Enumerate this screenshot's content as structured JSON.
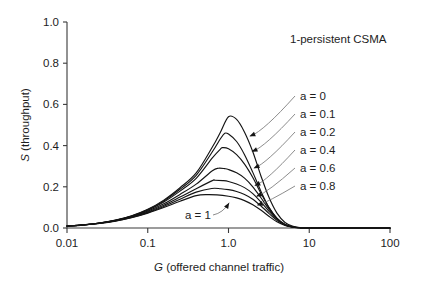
{
  "chart_data": {
    "type": "line",
    "title": "1-persistent CSMA",
    "xlabel": "G (offered channel traffic)",
    "ylabel": "S (throughput)",
    "xlabel_italic_prefix": "G",
    "xlabel_rest": " (offered channel traffic)",
    "ylabel_italic_prefix": "S",
    "ylabel_rest": " (throughput)",
    "xscale": "log",
    "xlim": [
      0.01,
      100
    ],
    "ylim": [
      0.0,
      1.0
    ],
    "grid": false,
    "legend_position": "inline-annotations",
    "xticks": [
      "0.01",
      "0.1",
      "1.0",
      "10",
      "100"
    ],
    "xtick_values": [
      0.01,
      0.1,
      1.0,
      10,
      100
    ],
    "yticks": [
      "0.0",
      "0.2",
      "0.4",
      "0.6",
      "0.8",
      "1.0"
    ],
    "ytick_values": [
      0.0,
      0.2,
      0.4,
      0.6,
      0.8,
      1.0
    ],
    "series": [
      {
        "name": "a = 0",
        "a": 0,
        "peak_x": 1.0,
        "peak_y": 0.54,
        "x": [
          0.01,
          0.0158,
          0.0251,
          0.0398,
          0.0631,
          0.1,
          0.158,
          0.251,
          0.398,
          0.631,
          0.794,
          1.0,
          1.26,
          1.58,
          2.0,
          2.51,
          3.16,
          3.98,
          5.01,
          6.31,
          7.94,
          10,
          15.8,
          25.1,
          100
        ],
        "values": [
          0.0099,
          0.0156,
          0.0245,
          0.0383,
          0.0594,
          0.0906,
          0.1353,
          0.1955,
          0.2672,
          0.393,
          0.465,
          0.54,
          0.527,
          0.465,
          0.37,
          0.255,
          0.15,
          0.072,
          0.027,
          0.008,
          0.002,
          0.0005,
          0.0,
          0.0,
          0.0
        ]
      },
      {
        "name": "a = 0.1",
        "a": 0.1,
        "peak_x": 0.9,
        "peak_y": 0.46,
        "x": [
          0.01,
          0.0158,
          0.0251,
          0.0398,
          0.0631,
          0.1,
          0.158,
          0.251,
          0.398,
          0.631,
          0.794,
          0.9,
          1.0,
          1.26,
          1.58,
          2.0,
          2.51,
          3.16,
          3.98,
          5.01,
          6.31,
          7.94,
          10,
          100
        ],
        "values": [
          0.0098,
          0.0154,
          0.0242,
          0.0378,
          0.0584,
          0.0886,
          0.131,
          0.188,
          0.256,
          0.37,
          0.433,
          0.46,
          0.456,
          0.42,
          0.356,
          0.27,
          0.18,
          0.1,
          0.045,
          0.015,
          0.004,
          0.001,
          0.0003,
          0.0
        ]
      },
      {
        "name": "a = 0.2",
        "a": 0.2,
        "peak_x": 0.85,
        "peak_y": 0.39,
        "x": [
          0.01,
          0.0158,
          0.0251,
          0.0398,
          0.0631,
          0.1,
          0.158,
          0.251,
          0.398,
          0.631,
          0.794,
          0.85,
          1.0,
          1.26,
          1.58,
          2.0,
          2.51,
          3.16,
          3.98,
          5.01,
          6.31,
          7.94,
          10,
          100
        ],
        "values": [
          0.0097,
          0.0152,
          0.0239,
          0.0372,
          0.0572,
          0.0862,
          0.1262,
          0.179,
          0.241,
          0.34,
          0.383,
          0.39,
          0.385,
          0.356,
          0.31,
          0.245,
          0.17,
          0.1,
          0.048,
          0.017,
          0.005,
          0.0012,
          0.0004,
          0.0
        ]
      },
      {
        "name": "a = 0.4",
        "a": 0.4,
        "peak_x": 0.75,
        "peak_y": 0.29,
        "x": [
          0.01,
          0.0158,
          0.0251,
          0.0398,
          0.0631,
          0.1,
          0.158,
          0.251,
          0.398,
          0.631,
          0.75,
          0.9,
          1.0,
          1.26,
          1.58,
          2.0,
          2.51,
          3.16,
          3.98,
          5.01,
          6.31,
          7.94,
          10,
          100
        ],
        "values": [
          0.0095,
          0.0149,
          0.0233,
          0.036,
          0.055,
          0.0818,
          0.1175,
          0.163,
          0.213,
          0.278,
          0.29,
          0.288,
          0.284,
          0.268,
          0.242,
          0.2,
          0.148,
          0.092,
          0.046,
          0.017,
          0.005,
          0.0012,
          0.0004,
          0.0
        ]
      },
      {
        "name": "a = 0.6",
        "a": 0.6,
        "peak_x": 0.68,
        "peak_y": 0.232,
        "x": [
          0.01,
          0.0158,
          0.0251,
          0.0398,
          0.0631,
          0.1,
          0.158,
          0.251,
          0.398,
          0.631,
          0.68,
          0.85,
          1.0,
          1.26,
          1.58,
          2.0,
          2.51,
          3.16,
          3.98,
          5.01,
          6.31,
          7.94,
          10,
          100
        ],
        "values": [
          0.0094,
          0.0146,
          0.0228,
          0.035,
          0.0531,
          0.078,
          0.1105,
          0.15,
          0.191,
          0.23,
          0.232,
          0.23,
          0.226,
          0.214,
          0.196,
          0.167,
          0.127,
          0.082,
          0.042,
          0.016,
          0.0048,
          0.0011,
          0.0004,
          0.0
        ]
      },
      {
        "name": "a = 0.8",
        "a": 0.8,
        "peak_x": 0.62,
        "peak_y": 0.192,
        "x": [
          0.01,
          0.0158,
          0.0251,
          0.0398,
          0.0631,
          0.1,
          0.158,
          0.251,
          0.398,
          0.62,
          0.8,
          1.0,
          1.26,
          1.58,
          2.0,
          2.51,
          3.16,
          3.98,
          5.01,
          6.31,
          7.94,
          10,
          100
        ],
        "values": [
          0.0093,
          0.0144,
          0.0224,
          0.0342,
          0.0515,
          0.0748,
          0.1045,
          0.1395,
          0.174,
          0.192,
          0.1905,
          0.186,
          0.177,
          0.163,
          0.14,
          0.108,
          0.071,
          0.037,
          0.0145,
          0.0044,
          0.001,
          0.0003,
          0.0
        ]
      },
      {
        "name": "a = 1",
        "a": 1,
        "peak_x": 0.55,
        "peak_y": 0.162,
        "x": [
          0.01,
          0.0158,
          0.0251,
          0.0398,
          0.0631,
          0.1,
          0.158,
          0.251,
          0.398,
          0.55,
          0.72,
          1.0,
          1.26,
          1.58,
          2.0,
          2.51,
          3.16,
          3.98,
          5.01,
          6.31,
          7.94,
          10,
          100
        ],
        "values": [
          0.0092,
          0.0142,
          0.022,
          0.0335,
          0.0502,
          0.0722,
          0.0995,
          0.13,
          0.157,
          0.162,
          0.1605,
          0.154,
          0.146,
          0.133,
          0.113,
          0.087,
          0.057,
          0.03,
          0.012,
          0.0038,
          0.0009,
          0.0003,
          0.0
        ]
      }
    ],
    "annotations": [
      {
        "text": "a = 0",
        "label_x": 300,
        "label_y": 100
      },
      {
        "text": "a = 0.1",
        "label_x": 300,
        "label_y": 118
      },
      {
        "text": "a = 0.2",
        "label_x": 300,
        "label_y": 136
      },
      {
        "text": "a = 0.4",
        "label_x": 300,
        "label_y": 154
      },
      {
        "text": "a = 0.6",
        "label_x": 300,
        "label_y": 172
      },
      {
        "text": "a = 0.8",
        "label_x": 300,
        "label_y": 190
      },
      {
        "text": "a = 1",
        "label_x": 185,
        "label_y": 219
      }
    ]
  }
}
